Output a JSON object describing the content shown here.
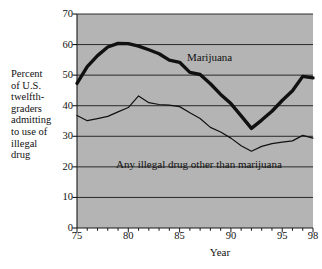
{
  "chart_data": {
    "type": "line",
    "title": "",
    "xlabel": "Year",
    "ylabel": "Percent of U.S. twelfth-graders admitting to use of illegal drug",
    "xlim": [
      75,
      98
    ],
    "ylim": [
      0,
      70
    ],
    "grid": true,
    "legend_position": "inline-annotations",
    "background_color": "#b4b4b4",
    "x": [
      75,
      76,
      77,
      78,
      79,
      80,
      81,
      82,
      83,
      84,
      85,
      86,
      87,
      88,
      89,
      90,
      91,
      92,
      93,
      94,
      95,
      96,
      97,
      98
    ],
    "series": [
      {
        "name": "Marijuana",
        "line_weight": "thick",
        "color": "#111111",
        "values": [
          47.3,
          52.8,
          56.4,
          59.2,
          60.4,
          60.3,
          59.5,
          58.3,
          57.0,
          54.9,
          54.2,
          50.9,
          50.2,
          47.2,
          43.7,
          40.7,
          36.7,
          32.6,
          35.3,
          38.2,
          41.7,
          44.9,
          49.6,
          49.1
        ]
      },
      {
        "name": "Any illegal drug other than marijuana",
        "line_weight": "thin",
        "color": "#111111",
        "values": [
          36.8,
          35.1,
          35.8,
          36.5,
          38.0,
          39.4,
          43.2,
          41.0,
          40.4,
          40.2,
          39.7,
          37.7,
          35.8,
          32.9,
          31.4,
          29.4,
          26.9,
          25.1,
          26.7,
          27.6,
          28.1,
          28.5,
          30.3,
          29.4
        ]
      }
    ],
    "yticks": [
      0,
      10,
      20,
      30,
      40,
      50,
      60,
      70
    ],
    "xticks_labeled": [
      75,
      80,
      85,
      90,
      95,
      98
    ],
    "annotations": [
      {
        "text": "Marijuana",
        "x": 86.5,
        "y": 54.0
      },
      {
        "text": "Any illegal drug other than marijuana",
        "x": 86.0,
        "y": 22.5
      }
    ]
  },
  "axis": {
    "y_description_lines": [
      "Percent",
      "of U.S.",
      "twelfth-",
      "graders",
      "admitting",
      "to use of",
      "illegal",
      "drug"
    ],
    "x_title": "Year"
  }
}
